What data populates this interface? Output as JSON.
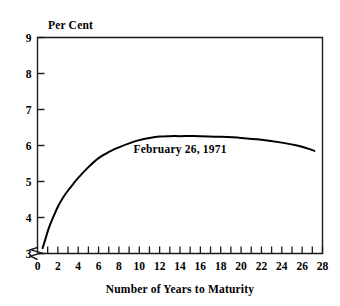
{
  "chart_data": {
    "type": "line",
    "title": "",
    "ylabel": "Per Cent",
    "xlabel": "Number of Years to Maturity",
    "xlim": [
      0,
      28
    ],
    "ylim": [
      3,
      9
    ],
    "y_axis_break": true,
    "y_break_note": "zigzag break below 3",
    "grid": false,
    "legend_position": "none",
    "xticks": [
      0,
      2,
      4,
      6,
      8,
      10,
      12,
      14,
      16,
      18,
      20,
      22,
      24,
      26,
      28
    ],
    "xtick_labels": [
      "0",
      "2",
      "4",
      "6",
      "8",
      "10",
      "12",
      "14",
      "16",
      "18",
      "20",
      "22",
      "24",
      "26",
      "28"
    ],
    "x_minor_tick_step": 1,
    "yticks": [
      3,
      4,
      5,
      6,
      7,
      8,
      9
    ],
    "ytick_labels": [
      "3",
      "4",
      "5",
      "6",
      "7",
      "8",
      "9"
    ],
    "annotations": [
      {
        "text": "February 26, 1971",
        "x": 14.0,
        "y": 5.78
      }
    ],
    "series": [
      {
        "name": "February 26, 1971",
        "color": "#000000",
        "x": [
          0.5,
          0.8,
          1.1,
          1.5,
          2.0,
          2.5,
          3.0,
          3.5,
          4.0,
          5.0,
          6.0,
          7.0,
          8.0,
          9.0,
          10.0,
          11.0,
          12.0,
          13.0,
          14.0,
          16.0,
          18.0,
          20.0,
          22.0,
          24.0,
          25.5,
          26.5,
          27.2
        ],
        "y": [
          3.15,
          3.42,
          3.7,
          3.98,
          4.3,
          4.55,
          4.75,
          4.93,
          5.1,
          5.4,
          5.65,
          5.82,
          5.95,
          6.06,
          6.15,
          6.21,
          6.25,
          6.26,
          6.26,
          6.26,
          6.24,
          6.21,
          6.16,
          6.08,
          6.0,
          5.92,
          5.85
        ]
      }
    ]
  },
  "axis_titles": {
    "y": "Per Cent",
    "x": "Number of Years to Maturity"
  }
}
